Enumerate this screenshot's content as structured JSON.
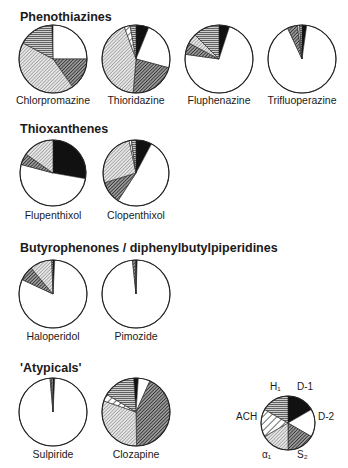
{
  "figure": {
    "legend": {
      "items": [
        {
          "key": "D1",
          "label": "D-1",
          "pattern": "solid-black"
        },
        {
          "key": "D2",
          "label": "D-2",
          "pattern": "white"
        },
        {
          "key": "S2",
          "label": "S₂",
          "pattern": "dense-dark-diagonal"
        },
        {
          "key": "A1",
          "label": "α₁",
          "pattern": "light-fine-diagonal"
        },
        {
          "key": "ACH",
          "label": "ACH",
          "pattern": "wide-diagonal"
        },
        {
          "key": "H1",
          "label": "H₁",
          "pattern": "horizontal-lines"
        }
      ]
    },
    "groups": [
      {
        "title": "Phenothiazines"
      },
      {
        "title": "Thioxanthenes"
      },
      {
        "title": "Butyrophenones / diphenylbutylpiperidines"
      },
      {
        "title": "'Atypicals'"
      }
    ]
  },
  "chart_data": {
    "type": "pie",
    "title": "",
    "units": "degrees of 360 (estimated relative receptor affinity profile)",
    "segment_order": [
      "D-1",
      "D-2",
      "S2",
      "alpha1",
      "ACH",
      "H1"
    ],
    "pies": [
      {
        "group": "Phenothiazines",
        "name": "Chlorpromazine",
        "start": -2,
        "values": [
          2,
          90,
          55,
          153,
          0,
          60
        ]
      },
      {
        "group": "Phenothiazines",
        "name": "Thioridazine",
        "start": 0,
        "values": [
          22,
          83,
          80,
          155,
          10,
          10
        ]
      },
      {
        "group": "Phenothiazines",
        "name": "Fluphenazine",
        "start": 0,
        "values": [
          18,
          260,
          20,
          17,
          0,
          45
        ]
      },
      {
        "group": "Phenothiazines",
        "name": "Trifluoperazine",
        "start": 0,
        "values": [
          8,
          327,
          17,
          4,
          0,
          4
        ]
      },
      {
        "group": "Thioxanthenes",
        "name": "Flupenthixol",
        "start": 0,
        "values": [
          100,
          185,
          20,
          55,
          0,
          0
        ]
      },
      {
        "group": "Thioxanthenes",
        "name": "Clopenthixol",
        "start": 0,
        "values": [
          28,
          185,
          40,
          95,
          4,
          8
        ]
      },
      {
        "group": "Butyrophenones / diphenylbutylpiperidines",
        "name": "Haloperidol",
        "start": 0,
        "values": [
          3,
          292,
          25,
          38,
          0,
          2
        ]
      },
      {
        "group": "Butyrophenones / diphenylbutylpiperidines",
        "name": "Pimozide",
        "start": 0,
        "values": [
          2,
          352,
          5,
          1,
          0,
          0
        ]
      },
      {
        "group": "'Atypicals'",
        "name": "Sulpiride",
        "start": 0,
        "values": [
          3,
          352,
          3,
          2,
          0,
          0
        ]
      },
      {
        "group": "'Atypicals'",
        "name": "Clozapine",
        "start": -4,
        "values": [
          8,
          20,
          155,
          110,
          12,
          55
        ]
      }
    ],
    "legend_pie": {
      "name": "Legend",
      "start": 0,
      "values": [
        60,
        60,
        60,
        60,
        60,
        60
      ]
    }
  }
}
